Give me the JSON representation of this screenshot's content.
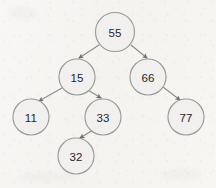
{
  "diagram": {
    "type": "binary-tree",
    "background_color": "#f7f6f3",
    "node_fill_color": "#f1f0ef",
    "node_stroke_color": "#9a9a9a",
    "edge_color": "#8e8e8e",
    "text_color": "#25262a",
    "node_radius": 18,
    "nodes": [
      {
        "id": "n55",
        "label": "55",
        "cx": 115,
        "cy": 32,
        "r": 19.5
      },
      {
        "id": "n15",
        "label": "15",
        "cx": 77,
        "cy": 77,
        "r": 18
      },
      {
        "id": "n66",
        "label": "66",
        "cx": 148,
        "cy": 77,
        "r": 18
      },
      {
        "id": "n11",
        "label": "11",
        "cx": 31,
        "cy": 117,
        "r": 18
      },
      {
        "id": "n33",
        "label": "33",
        "cx": 103,
        "cy": 117,
        "r": 18
      },
      {
        "id": "n77",
        "label": "77",
        "cx": 186,
        "cy": 117,
        "r": 18
      },
      {
        "id": "n32",
        "label": "32",
        "cx": 76,
        "cy": 156,
        "r": 18
      }
    ],
    "edges": [
      {
        "id": "e55-15",
        "from": "n55",
        "to": "n15",
        "x1": 99,
        "y1": 45,
        "x2": 79,
        "y2": 58
      },
      {
        "id": "e55-66",
        "from": "n55",
        "to": "n66",
        "x1": 131,
        "y1": 45,
        "x2": 147,
        "y2": 58
      },
      {
        "id": "e15-11",
        "from": "n15",
        "to": "n11",
        "x1": 62,
        "y1": 88,
        "x2": 39,
        "y2": 101
      },
      {
        "id": "e15-33",
        "from": "n15",
        "to": "n33",
        "x1": 88,
        "y1": 90,
        "x2": 101,
        "y2": 98
      },
      {
        "id": "e66-77",
        "from": "n66",
        "to": "n77",
        "x1": 163,
        "y1": 87,
        "x2": 180,
        "y2": 100
      },
      {
        "id": "e33-32",
        "from": "n33",
        "to": "n32",
        "x1": 93,
        "y1": 130,
        "x2": 80,
        "y2": 138
      }
    ]
  }
}
